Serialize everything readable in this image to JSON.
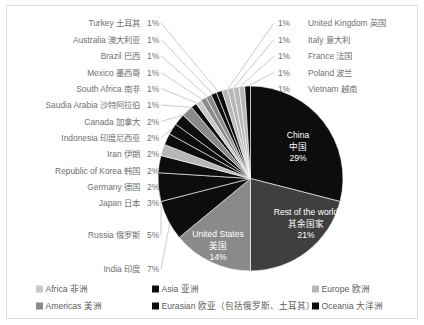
{
  "chart_data": {
    "type": "pie",
    "title": "",
    "subtitle": "",
    "xlabel": "",
    "ylabel": "",
    "grid": false,
    "legend_position": "bottom",
    "start_angle_deg": 0,
    "direction": "clockwise",
    "categories": [
      "China 中国",
      "Rest of the world 其余国家",
      "United States 美国",
      "India 印度",
      "Russia 俄罗斯",
      "Japan 日本",
      "Germany 德国",
      "Republic of Korea 韩国",
      "Iran 伊朗",
      "Indonesia 印度尼西亚",
      "Canada 加拿大",
      "Saudia Arabia 沙特阿拉伯",
      "South Africa 南非",
      "Mexico 墨西哥",
      "Brazil 巴西",
      "Australia 澳大利亚",
      "Turkey 土耳其",
      "United Kingdom 英国",
      "Italy 意大利",
      "France 法国",
      "Poland 波兰",
      "Vietnam 越南"
    ],
    "values": [
      29,
      21,
      14,
      7,
      5,
      3,
      2,
      2,
      2,
      2,
      2,
      1,
      1,
      1,
      1,
      1,
      1,
      1,
      1,
      1,
      1,
      1
    ],
    "slices": [
      {
        "name_en": "China",
        "name_zh": "中国",
        "pct": 29,
        "pct_label": "29%",
        "region": "Asia",
        "color": "#0d0d0d",
        "label_placement": "inside"
      },
      {
        "name_en": "Rest of the world",
        "name_zh": "其余国家",
        "pct": 21,
        "pct_label": "21%",
        "region": "Rest",
        "color": "#3f3f3f",
        "label_placement": "inside"
      },
      {
        "name_en": "United States",
        "name_zh": "美国",
        "pct": 14,
        "pct_label": "14%",
        "region": "Americas",
        "color": "#8a8a8a",
        "label_placement": "inside"
      },
      {
        "name_en": "India",
        "name_zh": "印度",
        "pct": 7,
        "pct_label": "7%",
        "region": "Asia",
        "color": "#0d0d0d",
        "label_placement": "left"
      },
      {
        "name_en": "Russia",
        "name_zh": "俄罗斯",
        "pct": 5,
        "pct_label": "5%",
        "region": "Eurasian",
        "color": "#0d0d0d",
        "label_placement": "left"
      },
      {
        "name_en": "Japan",
        "name_zh": "日本",
        "pct": 3,
        "pct_label": "3%",
        "region": "Asia",
        "color": "#0d0d0d",
        "label_placement": "left"
      },
      {
        "name_en": "Germany",
        "name_zh": "德国",
        "pct": 2,
        "pct_label": "2%",
        "region": "Europe",
        "color": "#b7b7b7",
        "label_placement": "left"
      },
      {
        "name_en": "Republic of Korea",
        "name_zh": "韩国",
        "pct": 2,
        "pct_label": "2%",
        "region": "Asia",
        "color": "#0d0d0d",
        "label_placement": "left"
      },
      {
        "name_en": "Iran",
        "name_zh": "伊朗",
        "pct": 2,
        "pct_label": "2%",
        "region": "Asia",
        "color": "#0d0d0d",
        "label_placement": "left"
      },
      {
        "name_en": "Indonesia",
        "name_zh": "印度尼西亚",
        "pct": 2,
        "pct_label": "2%",
        "region": "Asia",
        "color": "#0d0d0d",
        "label_placement": "left"
      },
      {
        "name_en": "Canada",
        "name_zh": "加拿大",
        "pct": 2,
        "pct_label": "2%",
        "region": "Americas",
        "color": "#8a8a8a",
        "label_placement": "left"
      },
      {
        "name_en": "Saudia Arabia",
        "name_zh": "沙特阿拉伯",
        "pct": 1,
        "pct_label": "1%",
        "region": "Asia",
        "color": "#0d0d0d",
        "label_placement": "left"
      },
      {
        "name_en": "South Africa",
        "name_zh": "南非",
        "pct": 1,
        "pct_label": "1%",
        "region": "Africa",
        "color": "#c9c9c9",
        "label_placement": "left"
      },
      {
        "name_en": "Mexico",
        "name_zh": "墨西哥",
        "pct": 1,
        "pct_label": "1%",
        "region": "Americas",
        "color": "#8a8a8a",
        "label_placement": "left"
      },
      {
        "name_en": "Brazil",
        "name_zh": "巴西",
        "pct": 1,
        "pct_label": "1%",
        "region": "Americas",
        "color": "#8a8a8a",
        "label_placement": "left"
      },
      {
        "name_en": "Australia",
        "name_zh": "澳大利亚",
        "pct": 1,
        "pct_label": "1%",
        "region": "Oceania",
        "color": "#0d0d0d",
        "label_placement": "left"
      },
      {
        "name_en": "Turkey",
        "name_zh": "土耳其",
        "pct": 1,
        "pct_label": "1%",
        "region": "Eurasian",
        "color": "#0d0d0d",
        "label_placement": "left"
      },
      {
        "name_en": "United Kingdom",
        "name_zh": "英国",
        "pct": 1,
        "pct_label": "1%",
        "region": "Europe",
        "color": "#b7b7b7",
        "label_placement": "right"
      },
      {
        "name_en": "Italy",
        "name_zh": "意大利",
        "pct": 1,
        "pct_label": "1%",
        "region": "Europe",
        "color": "#b7b7b7",
        "label_placement": "right"
      },
      {
        "name_en": "France",
        "name_zh": "法国",
        "pct": 1,
        "pct_label": "1%",
        "region": "Europe",
        "color": "#b7b7b7",
        "label_placement": "right"
      },
      {
        "name_en": "Poland",
        "name_zh": "波兰",
        "pct": 1,
        "pct_label": "1%",
        "region": "Europe",
        "color": "#b7b7b7",
        "label_placement": "right"
      },
      {
        "name_en": "Vietnam",
        "name_zh": "越南",
        "pct": 1,
        "pct_label": "1%",
        "region": "Asia",
        "color": "#0d0d0d",
        "label_placement": "right"
      }
    ],
    "legend": [
      {
        "label": "Africa 非洲",
        "color": "#c9c9c9"
      },
      {
        "label": "Asia 亚洲",
        "color": "#0d0d0d"
      },
      {
        "label": "Europe 欧洲",
        "color": "#b7b7b7"
      },
      {
        "label": "Americas 美洲",
        "color": "#8a8a8a"
      },
      {
        "label": "Eurasian 欧亚（包括俄罗斯、土耳其）",
        "color": "#0d0d0d"
      },
      {
        "label": "Oceania 大洋洲",
        "color": "#0d0d0d"
      }
    ]
  },
  "left_labels": [
    {
      "name": "Turkey 土耳其",
      "pct": "1%"
    },
    {
      "name": "Australia 澳大利亚",
      "pct": "1%"
    },
    {
      "name": "Brazil 巴西",
      "pct": "1%"
    },
    {
      "name": "Mexico 墨西哥",
      "pct": "1%"
    },
    {
      "name": "South Africa 南非",
      "pct": "1%"
    },
    {
      "name": "Saudia Arabia 沙特阿拉伯",
      "pct": "1%"
    },
    {
      "name": "Canada 加拿大",
      "pct": "2%"
    },
    {
      "name": "Indonesia 印度尼西亚",
      "pct": "2%"
    },
    {
      "name": "Iran 伊朗",
      "pct": "2%"
    },
    {
      "name": "Republic of Korea 韩国",
      "pct": "2%"
    },
    {
      "name": "Germany 德国",
      "pct": "2%"
    },
    {
      "name": "Japan 日本",
      "pct": "3%"
    },
    {
      "name": "Russia 俄罗斯",
      "pct": "5%"
    },
    {
      "name": "India 印度",
      "pct": "7%"
    }
  ],
  "right_labels": [
    {
      "name": "United Kingdom 英国",
      "pct": "1%"
    },
    {
      "name": "Italy 意大利",
      "pct": "1%"
    },
    {
      "name": "France 法国",
      "pct": "1%"
    },
    {
      "name": "Poland 波兰",
      "pct": "1%"
    },
    {
      "name": "Vietnam 越南",
      "pct": "1%"
    }
  ],
  "inside_labels": [
    {
      "name_en": "China",
      "name_zh": "中国",
      "pct": "29%"
    },
    {
      "name_en": "Rest of the world",
      "name_zh": "其余国家",
      "pct": "21%"
    },
    {
      "name_en": "United States",
      "name_zh": "美国",
      "pct": "14%"
    }
  ]
}
